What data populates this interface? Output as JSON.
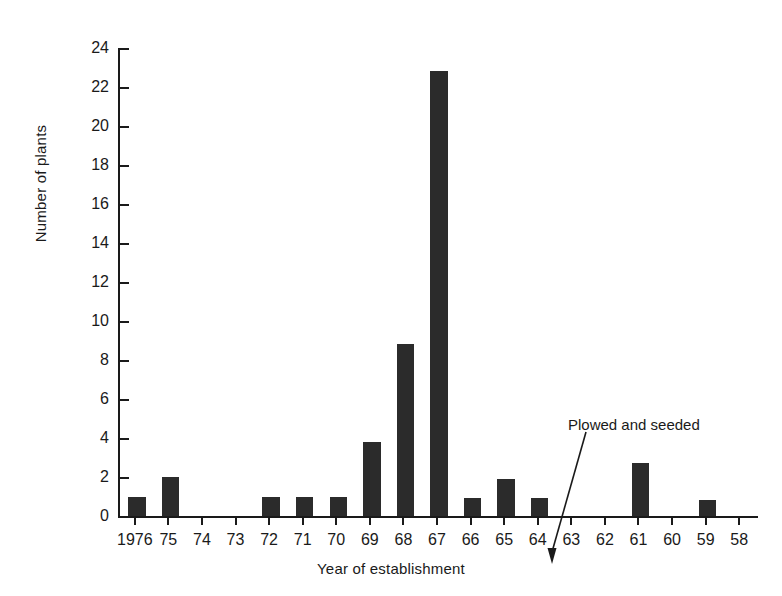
{
  "chart_data": {
    "type": "bar",
    "title": "",
    "xlabel": "Year of establishment",
    "ylabel": "Number of plants",
    "categories": [
      "1976",
      "75",
      "74",
      "73",
      "72",
      "71",
      "70",
      "69",
      "68",
      "67",
      "66",
      "65",
      "64",
      "63",
      "62",
      "61",
      "60",
      "59",
      "58"
    ],
    "values": [
      1,
      2,
      0,
      0,
      1,
      1,
      1,
      3.8,
      8.8,
      22.8,
      0.9,
      1.9,
      0.9,
      0,
      0,
      2.7,
      0,
      0.8,
      0
    ],
    "ylim": [
      0,
      24
    ],
    "ytick_values": [
      0,
      2,
      4,
      6,
      8,
      10,
      12,
      14,
      16,
      18,
      20,
      22,
      24
    ],
    "ytick_labels": [
      "0",
      "2",
      "4",
      "6",
      "8",
      "10",
      "12",
      "14",
      "16",
      "18",
      "20",
      "22",
      "24"
    ],
    "grid": false,
    "legend": "none",
    "bar_color": "#2b2b2b",
    "axis_color": "#1a1a1a",
    "annotations": [
      {
        "text": "Plowed and seeded",
        "points_to_category": "67",
        "arrow": "down"
      }
    ]
  }
}
